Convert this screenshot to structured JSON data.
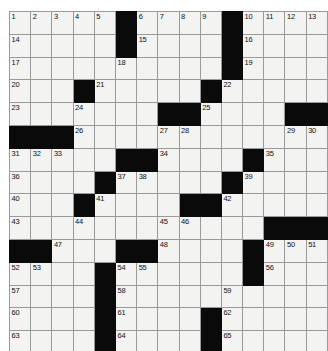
{
  "puzzle": {
    "kind": "crossword-grid",
    "title": "Crossword Puzzle Grid",
    "size": {
      "rows": 15,
      "cols": 15
    },
    "colors": {
      "block": "#0a0a0a",
      "cell": "#f3f3f1",
      "grid_line": "#9a9a9a",
      "number_text": "#111111",
      "page_background": "#ffffff"
    },
    "legend": {
      "black_symbol": "B",
      "open_symbol": "."
    },
    "grid": [
      [
        "1",
        "2",
        "3",
        "4",
        "5",
        "B",
        "6",
        "7",
        "8",
        "9",
        "B",
        "10",
        "11",
        "12",
        "13"
      ],
      [
        "14",
        ".",
        ".",
        ".",
        ".",
        "B",
        "15",
        ".",
        ".",
        ".",
        "B",
        "16",
        ".",
        ".",
        "."
      ],
      [
        "17",
        ".",
        ".",
        ".",
        ".",
        "18",
        ".",
        ".",
        ".",
        ".",
        "B",
        "19",
        ".",
        ".",
        "."
      ],
      [
        "20",
        ".",
        ".",
        "B",
        "21",
        ".",
        ".",
        ".",
        ".",
        "B",
        "22",
        ".",
        ".",
        ".",
        "."
      ],
      [
        "23",
        ".",
        ".",
        "24",
        ".",
        ".",
        ".",
        "B",
        "B",
        "25",
        ".",
        ".",
        ".",
        "B",
        "B"
      ],
      [
        "B",
        "B",
        "B",
        "26",
        ".",
        ".",
        ".",
        "27",
        "28",
        ".",
        ".",
        ".",
        ".",
        "29",
        "30"
      ],
      [
        "31",
        "32",
        "33",
        ".",
        ".",
        "B",
        "B",
        "34",
        ".",
        ".",
        ".",
        "B",
        "35",
        ".",
        "."
      ],
      [
        "36",
        ".",
        ".",
        ".",
        "B",
        "37",
        "38",
        ".",
        ".",
        ".",
        "B",
        "39",
        ".",
        ".",
        "."
      ],
      [
        "40",
        ".",
        ".",
        "B",
        "41",
        ".",
        ".",
        ".",
        "B",
        "B",
        "42",
        ".",
        ".",
        ".",
        "."
      ],
      [
        "43",
        ".",
        ".",
        "44",
        ".",
        ".",
        ".",
        "45",
        "46",
        ".",
        ".",
        ".",
        "B",
        "B",
        "B"
      ],
      [
        "B",
        "B",
        "47",
        ".",
        ".",
        "B",
        "B",
        "48",
        ".",
        ".",
        ".",
        "B",
        "49",
        "50",
        "51"
      ],
      [
        "52",
        "53",
        ".",
        ".",
        "B",
        "54",
        "55",
        ".",
        ".",
        ".",
        ".",
        "B",
        "56",
        ".",
        "."
      ],
      [
        "57",
        ".",
        ".",
        ".",
        "B",
        "58",
        ".",
        ".",
        ".",
        ".",
        "59",
        ".",
        ".",
        ".",
        "."
      ],
      [
        "60",
        ".",
        ".",
        ".",
        "B",
        "61",
        ".",
        ".",
        ".",
        "B",
        "62",
        ".",
        ".",
        ".",
        "."
      ],
      [
        "63",
        ".",
        ".",
        ".",
        "B",
        "64",
        ".",
        ".",
        ".",
        "B",
        "65",
        ".",
        ".",
        ".",
        "."
      ]
    ],
    "numbered_cells": [
      {
        "number": "1",
        "row": 1,
        "col": 1
      },
      {
        "number": "2",
        "row": 1,
        "col": 2
      },
      {
        "number": "3",
        "row": 1,
        "col": 3
      },
      {
        "number": "4",
        "row": 1,
        "col": 4
      },
      {
        "number": "5",
        "row": 1,
        "col": 5
      },
      {
        "number": "6",
        "row": 1,
        "col": 7
      },
      {
        "number": "7",
        "row": 1,
        "col": 8
      },
      {
        "number": "8",
        "row": 1,
        "col": 9
      },
      {
        "number": "9",
        "row": 1,
        "col": 10
      },
      {
        "number": "10",
        "row": 1,
        "col": 12
      },
      {
        "number": "11",
        "row": 1,
        "col": 13
      },
      {
        "number": "12",
        "row": 1,
        "col": 14
      },
      {
        "number": "13",
        "row": 1,
        "col": 15
      },
      {
        "number": "14",
        "row": 2,
        "col": 1
      },
      {
        "number": "15",
        "row": 2,
        "col": 7
      },
      {
        "number": "16",
        "row": 2,
        "col": 12
      },
      {
        "number": "17",
        "row": 3,
        "col": 1
      },
      {
        "number": "18",
        "row": 3,
        "col": 6
      },
      {
        "number": "19",
        "row": 3,
        "col": 12
      },
      {
        "number": "20",
        "row": 4,
        "col": 1
      },
      {
        "number": "21",
        "row": 4,
        "col": 5
      },
      {
        "number": "22",
        "row": 4,
        "col": 11
      },
      {
        "number": "23",
        "row": 5,
        "col": 1
      },
      {
        "number": "24",
        "row": 5,
        "col": 4
      },
      {
        "number": "25",
        "row": 5,
        "col": 10
      },
      {
        "number": "26",
        "row": 6,
        "col": 4
      },
      {
        "number": "27",
        "row": 6,
        "col": 8
      },
      {
        "number": "28",
        "row": 6,
        "col": 9
      },
      {
        "number": "29",
        "row": 6,
        "col": 14
      },
      {
        "number": "30",
        "row": 6,
        "col": 15
      },
      {
        "number": "31",
        "row": 7,
        "col": 1
      },
      {
        "number": "32",
        "row": 7,
        "col": 2
      },
      {
        "number": "33",
        "row": 7,
        "col": 3
      },
      {
        "number": "34",
        "row": 7,
        "col": 8
      },
      {
        "number": "35",
        "row": 7,
        "col": 13
      },
      {
        "number": "36",
        "row": 8,
        "col": 1
      },
      {
        "number": "37",
        "row": 8,
        "col": 6
      },
      {
        "number": "38",
        "row": 8,
        "col": 7
      },
      {
        "number": "39",
        "row": 8,
        "col": 12
      },
      {
        "number": "40",
        "row": 9,
        "col": 1
      },
      {
        "number": "41",
        "row": 9,
        "col": 5
      },
      {
        "number": "42",
        "row": 9,
        "col": 11
      },
      {
        "number": "43",
        "row": 10,
        "col": 1
      },
      {
        "number": "44",
        "row": 10,
        "col": 4
      },
      {
        "number": "45",
        "row": 10,
        "col": 8
      },
      {
        "number": "46",
        "row": 10,
        "col": 9
      },
      {
        "number": "47",
        "row": 11,
        "col": 3
      },
      {
        "number": "48",
        "row": 11,
        "col": 8
      },
      {
        "number": "49",
        "row": 11,
        "col": 13
      },
      {
        "number": "50",
        "row": 11,
        "col": 14
      },
      {
        "number": "51",
        "row": 11,
        "col": 15
      },
      {
        "number": "52",
        "row": 12,
        "col": 1
      },
      {
        "number": "53",
        "row": 12,
        "col": 2
      },
      {
        "number": "54",
        "row": 12,
        "col": 6
      },
      {
        "number": "55",
        "row": 12,
        "col": 7
      },
      {
        "number": "56",
        "row": 12,
        "col": 13
      },
      {
        "number": "57",
        "row": 13,
        "col": 1
      },
      {
        "number": "58",
        "row": 13,
        "col": 6
      },
      {
        "number": "59",
        "row": 13,
        "col": 11
      },
      {
        "number": "60",
        "row": 14,
        "col": 1
      },
      {
        "number": "61",
        "row": 14,
        "col": 6
      },
      {
        "number": "62",
        "row": 14,
        "col": 11
      },
      {
        "number": "63",
        "row": 15,
        "col": 1
      },
      {
        "number": "64",
        "row": 15,
        "col": 6
      },
      {
        "number": "65",
        "row": 15,
        "col": 11
      }
    ],
    "entered_letters": []
  }
}
